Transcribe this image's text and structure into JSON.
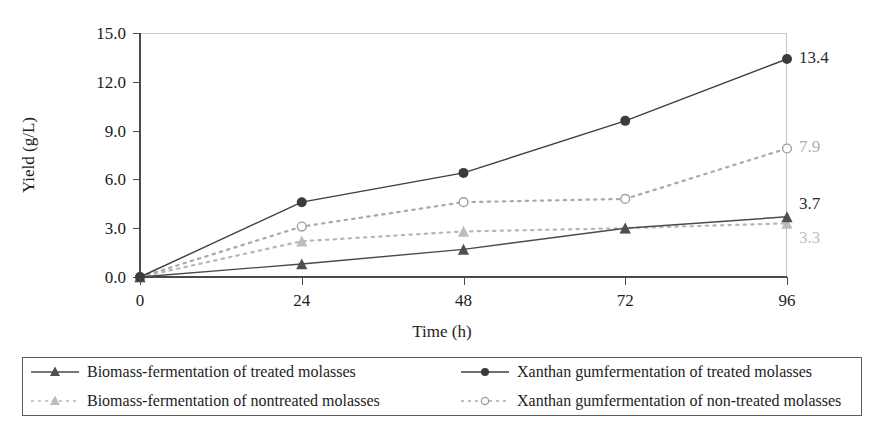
{
  "chart_data": {
    "type": "line",
    "title": "",
    "xlabel": "Time (h)",
    "ylabel": "Yield (g/L)",
    "x": [
      0,
      24,
      48,
      72,
      96
    ],
    "xticklabels": [
      "0",
      "24",
      "48",
      "72",
      "96"
    ],
    "yticklabels": [
      "0.0",
      "3.0",
      "6.0",
      "9.0",
      "12.0",
      "15.0"
    ],
    "yticks": [
      0.0,
      3.0,
      6.0,
      9.0,
      12.0,
      15.0
    ],
    "ylim": [
      0,
      15
    ],
    "xlim": [
      0,
      96
    ],
    "grid": false,
    "legend_position": "bottom",
    "series": [
      {
        "name": "Biomass-fermentation of treated molasses",
        "values": [
          0.0,
          0.8,
          1.7,
          3.0,
          3.7
        ],
        "end_label": "3.7",
        "color": "#4a4a4a",
        "marker": "triangle-filled",
        "line_style": "solid"
      },
      {
        "name": "Xanthan gumfermentation of treated molasses",
        "values": [
          0.0,
          4.6,
          6.4,
          9.6,
          13.4
        ],
        "end_label": "13.4",
        "color": "#3f3f3f",
        "marker": "circle-filled",
        "line_style": "solid"
      },
      {
        "name": "Biomass-fermentation of nontreated molasses",
        "values": [
          0.0,
          2.2,
          2.8,
          3.0,
          3.3
        ],
        "end_label": "3.3",
        "color": "#b7b7b7",
        "marker": "triangle-light",
        "line_style": "dotted"
      },
      {
        "name": "Xanthan gumfermentation of non-treated molasses",
        "values": [
          0.0,
          3.1,
          4.6,
          4.8,
          7.9
        ],
        "end_label": "7.9",
        "color": "#a9a9a9",
        "marker": "circle-open",
        "line_style": "dotted"
      }
    ],
    "data_labels": [
      {
        "text": "13.4",
        "color": "#2b2b2b"
      },
      {
        "text": "7.9",
        "color": "#b0b0b0"
      },
      {
        "text": "3.7",
        "color": "#2b2b2b"
      },
      {
        "text": "3.3",
        "color": "#c0c0c0"
      }
    ]
  },
  "legend": {
    "items": [
      {
        "label": "Biomass-fermentation of treated molasses",
        "marker": "triangle-filled",
        "line_style": "solid"
      },
      {
        "label": "Xanthan gumfermentation of treated molasses",
        "marker": "circle-filled",
        "line_style": "solid"
      },
      {
        "label": "Biomass-fermentation of nontreated molasses",
        "marker": "triangle-light",
        "line_style": "dotted"
      },
      {
        "label": "Xanthan gumfermentation of non-treated molasses",
        "marker": "circle-open",
        "line_style": "dotted"
      }
    ]
  }
}
